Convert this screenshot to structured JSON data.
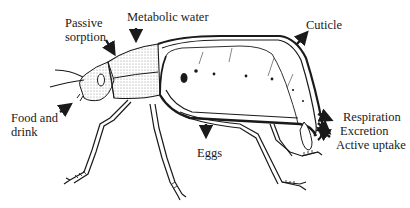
{
  "diagram": {
    "colors": {
      "ink": "#1a1a1a",
      "background": "#ffffff",
      "shade": "#8c8c8c"
    },
    "labels": {
      "passive_sorption": {
        "line1": "Passive",
        "line2": "sorption"
      },
      "metabolic_water": "Metabolic water",
      "cuticle": "Cuticle",
      "food_and_drink": {
        "line1": "Food and",
        "line2": "drink"
      },
      "eggs": "Eggs",
      "respiration": "Respiration",
      "excretion": "Excretion",
      "active_uptake": "Active uptake"
    },
    "arrows": [
      {
        "name": "passive-sorption-arrow",
        "direction": "in"
      },
      {
        "name": "metabolic-water-arrow",
        "direction": "in"
      },
      {
        "name": "cuticle-arrow",
        "direction": "out"
      },
      {
        "name": "food-and-drink-arrow",
        "direction": "in"
      },
      {
        "name": "eggs-arrow",
        "direction": "out"
      },
      {
        "name": "respiration-arrow",
        "direction": "out"
      },
      {
        "name": "excretion-arrow",
        "direction": "out"
      },
      {
        "name": "active-uptake-arrow",
        "direction": "in"
      }
    ]
  }
}
